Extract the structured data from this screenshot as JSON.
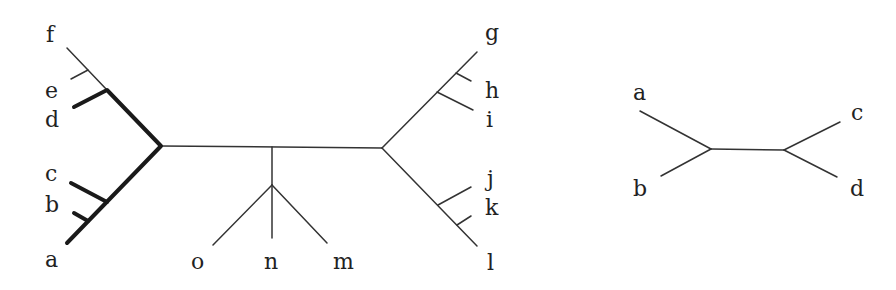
{
  "large_tree": {
    "leaves": {
      "f": "f",
      "e": "e",
      "d": "d",
      "c": "c",
      "b": "b",
      "a": "a",
      "o": "o",
      "n": "n",
      "m": "m",
      "g": "g",
      "h": "h",
      "i": "i",
      "j": "j",
      "k": "k",
      "l": "l"
    },
    "highlighted_subtree": [
      "a",
      "b",
      "c",
      "d"
    ],
    "highlight_style": "bold"
  },
  "small_tree": {
    "leaves": {
      "a": "a",
      "b": "b",
      "c": "c",
      "d": "d"
    },
    "topology": "((a,b),(c,d))"
  }
}
